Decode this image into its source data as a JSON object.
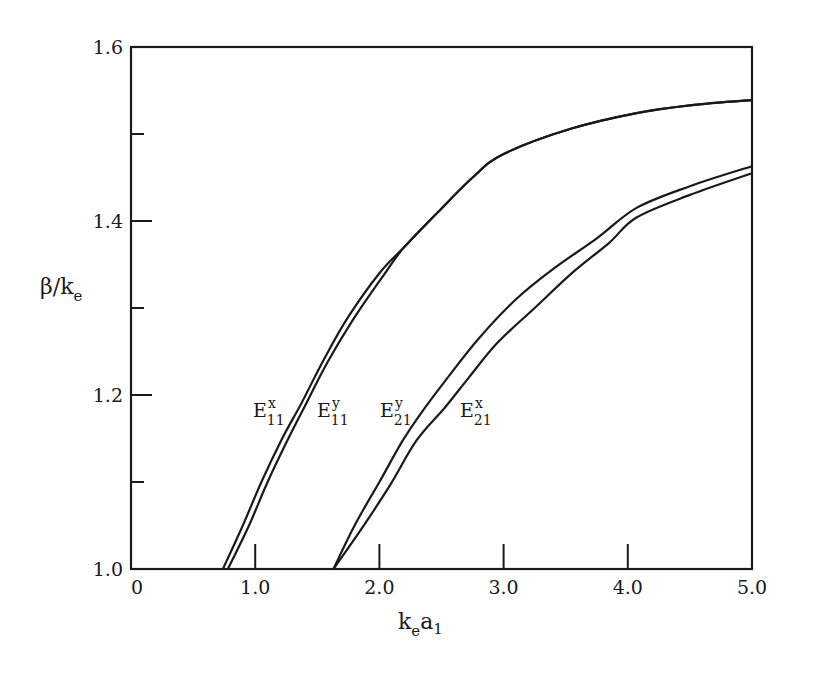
{
  "chart_data": {
    "type": "line",
    "title": "",
    "xlabel": "k_e a_1",
    "ylabel": "β/k_e",
    "xlim": [
      0,
      5.0
    ],
    "ylim": [
      1.0,
      1.6
    ],
    "grid": false,
    "legend": "inline labels",
    "x_ticks": [
      "0",
      "1.0",
      "2.0",
      "3.0",
      "4.0",
      "5.0"
    ],
    "y_ticks": [
      "1.0",
      "1.2",
      "1.4",
      "1.6"
    ],
    "y_minor_ticks": [
      1.1,
      1.3,
      1.5
    ],
    "series": [
      {
        "name": "E11x",
        "label_main": "E",
        "label_sup": "x",
        "label_sub": "11",
        "x": [
          0.74,
          0.9,
          1.05,
          1.21,
          1.37,
          1.55,
          1.75,
          2.0,
          2.2,
          2.47,
          2.75,
          3.0,
          3.54,
          4.07,
          4.5,
          5.0
        ],
        "y": [
          1.0,
          1.05,
          1.1,
          1.148,
          1.19,
          1.24,
          1.29,
          1.34,
          1.37,
          1.41,
          1.45,
          1.477,
          1.506,
          1.524,
          1.533,
          1.539
        ]
      },
      {
        "name": "E11y",
        "label_main": "E",
        "label_sup": "y",
        "label_sub": "11",
        "x": [
          0.78,
          0.95,
          1.1,
          1.26,
          1.41,
          1.58,
          1.78,
          2.02,
          2.2,
          2.47,
          2.75,
          3.0,
          3.54,
          4.07,
          4.5,
          5.0
        ],
        "y": [
          1.0,
          1.05,
          1.1,
          1.148,
          1.19,
          1.237,
          1.285,
          1.335,
          1.37,
          1.41,
          1.45,
          1.477,
          1.506,
          1.524,
          1.533,
          1.539
        ]
      },
      {
        "name": "E21y",
        "label_main": "E",
        "label_sup": "y",
        "label_sub": "21",
        "x": [
          1.63,
          1.8,
          2.0,
          2.19,
          2.37,
          2.55,
          2.8,
          3.1,
          3.4,
          3.75,
          4.07,
          4.5,
          5.0
        ],
        "y": [
          1.0,
          1.05,
          1.1,
          1.148,
          1.186,
          1.22,
          1.265,
          1.31,
          1.345,
          1.38,
          1.415,
          1.44,
          1.463
        ]
      },
      {
        "name": "E21x",
        "label_main": "E",
        "label_sup": "x",
        "label_sub": "21",
        "x": [
          1.63,
          1.85,
          2.08,
          2.3,
          2.53,
          2.72,
          2.95,
          3.25,
          3.55,
          3.85,
          4.07,
          4.5,
          5.0
        ],
        "y": [
          1.0,
          1.045,
          1.095,
          1.148,
          1.186,
          1.22,
          1.26,
          1.3,
          1.34,
          1.375,
          1.404,
          1.43,
          1.455
        ]
      }
    ],
    "annotations": [
      {
        "text": "E11x",
        "x": 1.0,
        "y": 1.18
      },
      {
        "text": "E11y",
        "x": 1.48,
        "y": 1.18
      },
      {
        "text": "E21y",
        "x": 1.98,
        "y": 1.18
      },
      {
        "text": "E21x",
        "x": 2.62,
        "y": 1.18
      }
    ]
  },
  "axes": {
    "xlabel_main": "k",
    "xlabel_sub1": "e",
    "xlabel_mid": "a",
    "xlabel_sub2": "1",
    "ylabel_main": "β/k",
    "ylabel_sub": "e"
  }
}
